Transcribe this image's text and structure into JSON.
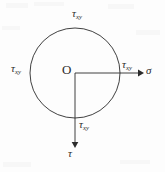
{
  "figure": {
    "kind": "mohr-circle-stress-diagram",
    "width": 165,
    "height": 172,
    "background_color": "#fdfdfd",
    "stroke_color": "#2b2b2b",
    "text_color": "#2b2b2b"
  },
  "geometry": {
    "circle": {
      "cx": 75,
      "cy": 73,
      "r": 45
    },
    "sigma_axis": {
      "x1": 75,
      "y1": 73,
      "x2": 140,
      "y2": 73
    },
    "tau_axis": {
      "x1": 75,
      "y1": 73,
      "x2": 75,
      "y2": 146
    }
  },
  "labels": {
    "origin": "O",
    "sigma_axis": "σ",
    "tau_axis": "τ",
    "tau_xy_symbol": "τ",
    "tau_xy_subscript": "xy",
    "tau_top": "τ",
    "tau_left": "τ",
    "tau_right": "τ",
    "tau_bottom": "τ"
  }
}
